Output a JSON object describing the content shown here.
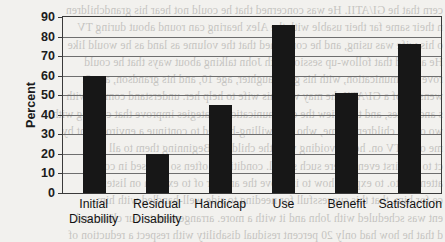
{
  "chart_data": {
    "type": "bar",
    "title": "",
    "xlabel": "",
    "ylabel": "Percent",
    "ylim": [
      0,
      90
    ],
    "ytick_step": 10,
    "yticks": [
      0,
      10,
      20,
      30,
      40,
      50,
      60,
      70,
      80,
      90
    ],
    "grid": true,
    "legend": false,
    "bar_color": "#171717",
    "categories": [
      "Initial\nDisability",
      "Residual\nDisability",
      "Handicap",
      "Use",
      "Benefit",
      "Satisfaction"
    ],
    "values": [
      60,
      20,
      45,
      86,
      51,
      76
    ]
  },
  "background_text": {
    "note": "faint mirrored bleed-through from reverse of scanned page",
    "lines": [
      "cern that he GI/ATII. He was concerned that he could not hear his grandchildren",
      "n their same far their usable with the Alex hearing can round about during TV",
      "o his wife was using, and he confirmed that the volume as land as he would like",
      "He agreed that follow-up session with John talking about ways that he could",
      "rove communication, with his grandaughter, age 10, and his grandson, age 8.",
      "wensive of a GI/ATII: he may with his wife to help her. understand coming with",
      "s and issues, and to review the communication strategies improve that coming with",
      "wo oldest children, Jaime, who was willing-headed to continue a environment by",
      "me off a TV on. he is avoiding with the children. Beginning them to all",
      "ct to the first events were such signal. conditions. often so stressed in com-",
      "attention to. to explain how to improve the answer of to explain on listening",
      "ce for him. that this successfull for needing to side well-handled with him.",
      "ent was scheduled with John and it with a more. arrangement to our clinic and",
      "d that he how had only 20 percent residual disability with respect a reduction of"
    ]
  }
}
